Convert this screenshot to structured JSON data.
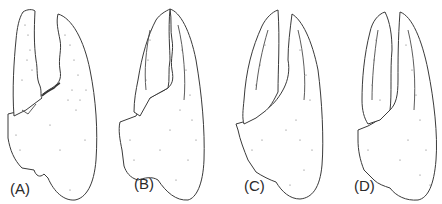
{
  "figure": {
    "panels": [
      {
        "id": "A",
        "label": "(A)"
      },
      {
        "id": "B",
        "label": "(B)"
      },
      {
        "id": "C",
        "label": "(C)"
      },
      {
        "id": "D",
        "label": "(D)"
      }
    ],
    "line_color": "#3a3a3a",
    "background": "#ffffff"
  }
}
